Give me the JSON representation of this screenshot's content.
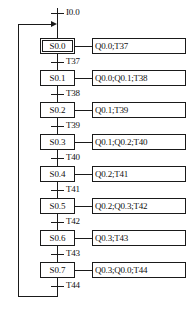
{
  "diagram": {
    "type": "sequential-function-chart",
    "initial_transition_label": "I0.0",
    "initial_step_id": "S0.0",
    "steps": [
      {
        "id": "S0.0",
        "label": "S0.0",
        "initial": true,
        "action": "Q0.0;T37",
        "transition": "T37"
      },
      {
        "id": "S0.1",
        "label": "S0.1",
        "initial": false,
        "action": "Q0.0;Q0.1;T38",
        "transition": "T38"
      },
      {
        "id": "S0.2",
        "label": "S0.2",
        "initial": false,
        "action": "Q0.1;T39",
        "transition": "T39"
      },
      {
        "id": "S0.3",
        "label": "S0.3",
        "initial": false,
        "action": "Q0.1;Q0.2;T40",
        "transition": "T40"
      },
      {
        "id": "S0.4",
        "label": "S0.4",
        "initial": false,
        "action": "Q0.2;T41",
        "transition": "T41"
      },
      {
        "id": "S0.5",
        "label": "S0.5",
        "initial": false,
        "action": "Q0.2;Q0.3;T42",
        "transition": "T42"
      },
      {
        "id": "S0.6",
        "label": "S0.6",
        "initial": false,
        "action": "Q0.3;T43",
        "transition": "T43"
      },
      {
        "id": "S0.7",
        "label": "S0.7",
        "initial": false,
        "action": "Q0.3;Q0.0;T44",
        "transition": "T44"
      }
    ],
    "colors": {
      "line": "#1a1a1a",
      "text": "#101010",
      "background": "#ffffff"
    }
  },
  "chart_data": {
    "type": "diagram",
    "nodes": [
      "S0.0",
      "S0.1",
      "S0.2",
      "S0.3",
      "S0.4",
      "S0.5",
      "S0.6",
      "S0.7"
    ],
    "initial_node": "S0.0",
    "entry_transition": "I0.0",
    "transitions": [
      {
        "from": "S0.0",
        "to": "S0.1",
        "condition": "T37"
      },
      {
        "from": "S0.1",
        "to": "S0.2",
        "condition": "T38"
      },
      {
        "from": "S0.2",
        "to": "S0.3",
        "condition": "T39"
      },
      {
        "from": "S0.3",
        "to": "S0.4",
        "condition": "T40"
      },
      {
        "from": "S0.4",
        "to": "S0.5",
        "condition": "T41"
      },
      {
        "from": "S0.5",
        "to": "S0.6",
        "condition": "T42"
      },
      {
        "from": "S0.6",
        "to": "S0.7",
        "condition": "T43"
      },
      {
        "from": "S0.7",
        "to": "S0.0",
        "condition": "T44"
      }
    ],
    "actions": [
      {
        "step": "S0.0",
        "outputs": "Q0.0;T37"
      },
      {
        "step": "S0.1",
        "outputs": "Q0.0;Q0.1;T38"
      },
      {
        "step": "S0.2",
        "outputs": "Q0.1;T39"
      },
      {
        "step": "S0.3",
        "outputs": "Q0.1;Q0.2;T40"
      },
      {
        "step": "S0.4",
        "outputs": "Q0.2;T41"
      },
      {
        "step": "S0.5",
        "outputs": "Q0.2;Q0.3;T42"
      },
      {
        "step": "S0.6",
        "outputs": "Q0.3;T43"
      },
      {
        "step": "S0.7",
        "outputs": "Q0.3;Q0.0;T44"
      }
    ],
    "loop": "S0.7 returns to S0.0 via T44 (left-side feedback path)"
  }
}
